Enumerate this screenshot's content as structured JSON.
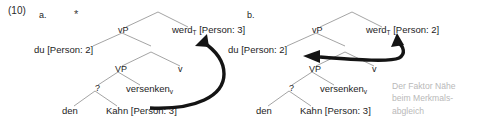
{
  "figure": {
    "example_number": "(10)",
    "grammaticality_marker": "*"
  },
  "panels": [
    {
      "letter": "a.",
      "nodes": {
        "vp_upper": "vP",
        "aux": "werd",
        "aux_subscript": "T",
        "aux_features": "[Person: 3]",
        "subject": "du [Person: 2]",
        "vp_lower": "VP",
        "little_v": "v",
        "unknown": "?",
        "verb": "versenken",
        "verb_subscript": "v",
        "determiner": "den",
        "object": "Kahn [Person: 3]"
      },
      "arrow": {
        "name": "agree-arrow-object-to-aux",
        "from": "Kahn [Person: 3]",
        "to": "werd_T [Person: 3]",
        "direction": "up-right"
      }
    },
    {
      "letter": "b.",
      "nodes": {
        "vp_upper": "vP",
        "aux": "werd",
        "aux_subscript": "T",
        "aux_features": "[Person: 2]",
        "subject": "du [Person: 2]",
        "vp_lower": "VP",
        "little_v": "v",
        "unknown": "?",
        "verb": "versenken",
        "verb_subscript": "v",
        "determiner": "den",
        "object": "Kahn [Person: 3]"
      },
      "arrow": {
        "name": "agree-arrow-aux-to-subject",
        "from": "werd_T [Person: 2]",
        "to": "du [Person: 2]",
        "direction": "left"
      }
    }
  ],
  "annotation": {
    "text": "Der Faktor Nähe\nbeim Merkmals-\nabgleich",
    "color": "#b9b9b9"
  }
}
